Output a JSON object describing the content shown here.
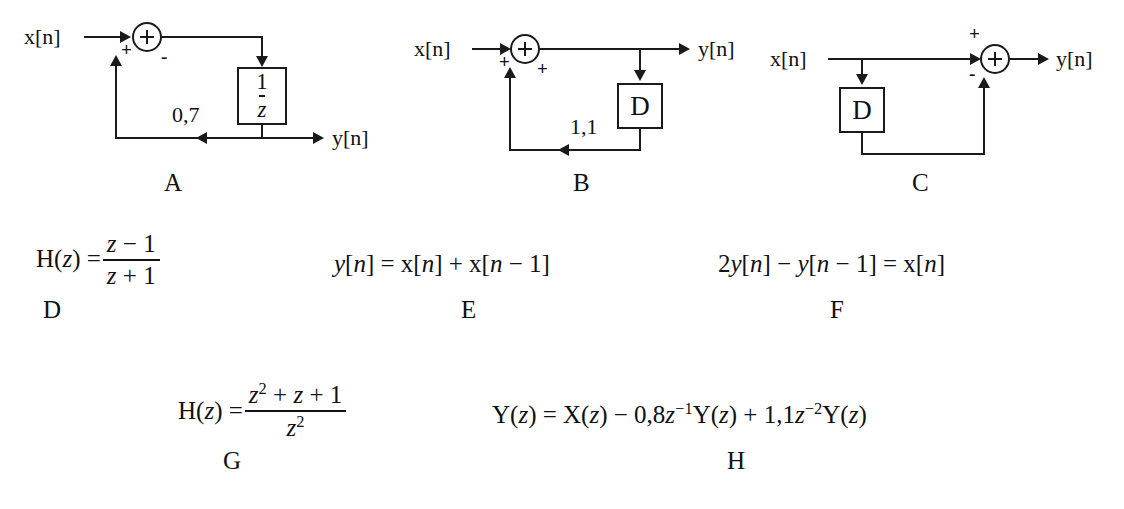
{
  "page": {
    "background": "#ffffff",
    "ink": "#1a1a1a"
  },
  "diagrams": [
    {
      "id": "A",
      "caption": "A",
      "input_label": "x[n]",
      "output_label": "y[n]",
      "adder_signs": [
        "+",
        "-"
      ],
      "gain_label": "0,7",
      "block_label_numerator": "1",
      "block_label_denominator": "z",
      "block_label": "1/z"
    },
    {
      "id": "B",
      "caption": "B",
      "input_label": "x[n]",
      "output_label": "y[n]",
      "adder_signs": [
        "+",
        "+"
      ],
      "gain_label": "1,1",
      "block_label": "D"
    },
    {
      "id": "C",
      "caption": "C",
      "input_label": "x[n]",
      "output_label": "y[n]",
      "adder_signs": [
        "+",
        "-"
      ],
      "gain_label": "",
      "block_label": "D"
    }
  ],
  "equations": [
    {
      "id": "D",
      "caption": "D",
      "text": "H(z) = (z - 1)/(z + 1)",
      "lhs": "H(z)",
      "relation": "=",
      "numerator": "z − 1",
      "denominator": "z + 1"
    },
    {
      "id": "E",
      "caption": "E",
      "text": "y[n] = x[n] + x[n - 1]"
    },
    {
      "id": "F",
      "caption": "F",
      "text": "2y[n] − y[n - 1] = x[n]"
    },
    {
      "id": "G",
      "caption": "G",
      "text": "H(z) = (z² + z + 1)/z²",
      "lhs": "H(z)",
      "relation": "=",
      "numerator": "z² + z + 1",
      "denominator": "z²"
    },
    {
      "id": "H",
      "caption": "H",
      "text": "Y(z) = X(z) − 0,8z⁻¹Y(z) + 1,1z⁻²Y(z)"
    }
  ],
  "labels": {
    "x_base": "x",
    "y_base": "y",
    "index_n": "n",
    "bracket_open": "[",
    "bracket_close": "]",
    "plus": "+",
    "minus": "-",
    "equals": "=",
    "z": "z",
    "one": "1",
    "two": "2",
    "D_letter": "D",
    "H_fn": "H(",
    "Y_fn": "Y(",
    "X_fn": "X(",
    "paren_close": ")",
    "gainA": "0,7",
    "gainB": "1,1",
    "coef_08": "0,8",
    "coef_11": "1,1",
    "coef_2": "2"
  }
}
